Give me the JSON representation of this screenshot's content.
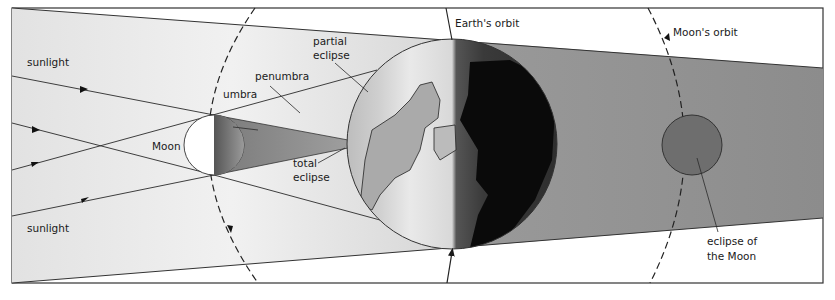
{
  "diagram": {
    "labels": {
      "sunlight_top": "sunlight",
      "sunlight_bottom": "sunlight",
      "moon": "Moon",
      "umbra": "umbra",
      "penumbra": "penumbra",
      "partial_eclipse_1": "partial",
      "partial_eclipse_2": "eclipse",
      "total_eclipse_1": "total",
      "total_eclipse_2": "eclipse",
      "earths_orbit": "Earth's orbit",
      "moons_orbit": "Moon's orbit",
      "eclipse_of_moon_1": "eclipse of",
      "eclipse_of_moon_2": "the Moon"
    },
    "colors": {
      "frame": "#333333",
      "line": "#2a2a2a",
      "earth_shadow": "#8a8a8a",
      "moon_lit": "#ffffff",
      "eclipsed_moon": "#6e6e6e",
      "earth_night": "#111111"
    }
  }
}
